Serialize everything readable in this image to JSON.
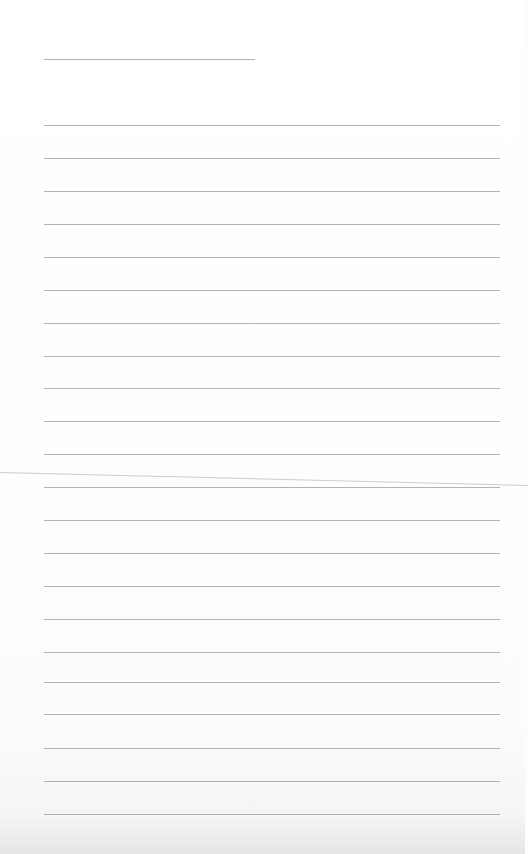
{
  "page": {
    "type": "lined-paper",
    "background": "#ffffff",
    "rule_color": "#9a9a9a",
    "header_line": {
      "x1": 44,
      "x2": 255,
      "y": 59
    },
    "ruled_lines": {
      "x1": 44,
      "x2": 500,
      "y": [
        125,
        158,
        191,
        224,
        257,
        290,
        323,
        356,
        388,
        421,
        454,
        487,
        520,
        553,
        586,
        619,
        652,
        682,
        714,
        748,
        781,
        814
      ]
    },
    "fold_line": {
      "from": [
        0,
        472
      ],
      "to": [
        525,
        485
      ]
    }
  }
}
